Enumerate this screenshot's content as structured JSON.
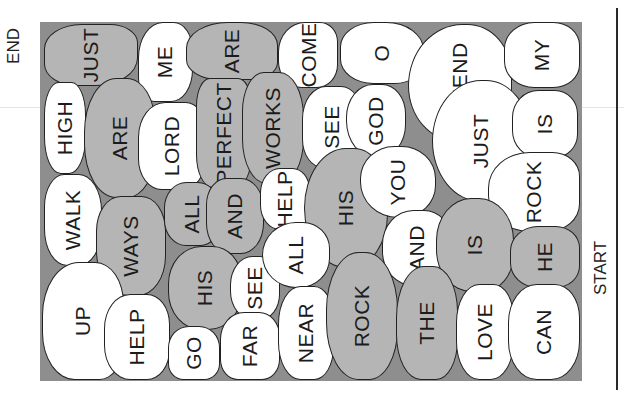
{
  "puzzle": {
    "type": "stepping-stone word path",
    "end_label": "END",
    "start_label": "START",
    "colors": {
      "board": "#8e8e8e",
      "path_stone": "#b5b5b5",
      "other_stone": "#ffffff",
      "outline": "#222222"
    },
    "stones": [
      {
        "word": "JUST",
        "tone": "g",
        "x": 4,
        "y": 2,
        "w": 94,
        "h": 62,
        "r": "40% 30% 45% 35%"
      },
      {
        "word": "ME",
        "tone": "w",
        "x": 98,
        "y": 0,
        "w": 55,
        "h": 80,
        "r": "45% 35% 40% 30%"
      },
      {
        "word": "ARE",
        "tone": "g",
        "x": 146,
        "y": 0,
        "w": 92,
        "h": 58,
        "r": "45% 40% 30% 35%"
      },
      {
        "word": "COME",
        "tone": "w",
        "x": 238,
        "y": 0,
        "w": 60,
        "h": 66,
        "r": "45% 30% 35% 40%"
      },
      {
        "word": "O",
        "tone": "w",
        "x": 300,
        "y": 0,
        "w": 84,
        "h": 62,
        "r": "40% 45% 35% 40%"
      },
      {
        "word": "FRIEND",
        "tone": "w",
        "x": 368,
        "y": 2,
        "w": 104,
        "h": 118,
        "r": "55% 45% 40% 50%"
      },
      {
        "word": "MY",
        "tone": "w",
        "x": 464,
        "y": 0,
        "w": 76,
        "h": 66,
        "r": "40% 35% 35% 40%"
      },
      {
        "word": "HIGH",
        "tone": "w",
        "x": 4,
        "y": 60,
        "w": 42,
        "h": 92,
        "r": "35% 35% 40% 40%"
      },
      {
        "word": "ARE",
        "tone": "g",
        "x": 44,
        "y": 56,
        "w": 72,
        "h": 120,
        "r": "45% 40% 40% 45%"
      },
      {
        "word": "LORD",
        "tone": "w",
        "x": 98,
        "y": 80,
        "w": 68,
        "h": 88,
        "r": "40% 30% 35% 35%"
      },
      {
        "word": "PERFECT",
        "tone": "g",
        "x": 156,
        "y": 56,
        "w": 56,
        "h": 110,
        "r": "25% 25% 30% 30%"
      },
      {
        "word": "WORKS",
        "tone": "g",
        "x": 202,
        "y": 50,
        "w": 62,
        "h": 112,
        "r": "35% 40% 40% 40%"
      },
      {
        "word": "SEE",
        "tone": "w",
        "x": 262,
        "y": 64,
        "w": 60,
        "h": 82,
        "r": "40% 35% 40% 35%"
      },
      {
        "word": "GOD",
        "tone": "w",
        "x": 306,
        "y": 62,
        "w": 60,
        "h": 74,
        "r": "45% 40% 45% 50%"
      },
      {
        "word": "JUST",
        "tone": "w",
        "x": 392,
        "y": 58,
        "w": 98,
        "h": 122,
        "r": "50% 45% 45% 50%"
      },
      {
        "word": "IS",
        "tone": "w",
        "x": 472,
        "y": 68,
        "w": 66,
        "h": 68,
        "r": "40% 35% 35% 40%"
      },
      {
        "word": "WALK",
        "tone": "w",
        "x": 4,
        "y": 152,
        "w": 58,
        "h": 92,
        "r": "35% 40% 40% 40%"
      },
      {
        "word": "WAYS",
        "tone": "g",
        "x": 56,
        "y": 174,
        "w": 70,
        "h": 100,
        "r": "35% 35% 40% 45%"
      },
      {
        "word": "ALL",
        "tone": "g",
        "x": 124,
        "y": 160,
        "w": 56,
        "h": 64,
        "r": "40% 40% 35% 40%"
      },
      {
        "word": "AND",
        "tone": "g",
        "x": 166,
        "y": 156,
        "w": 58,
        "h": 76,
        "r": "35% 40% 40% 40%"
      },
      {
        "word": "HELP",
        "tone": "w",
        "x": 220,
        "y": 146,
        "w": 50,
        "h": 62,
        "r": "40% 35% 35% 40%"
      },
      {
        "word": "HIS",
        "tone": "g",
        "x": 264,
        "y": 126,
        "w": 84,
        "h": 120,
        "r": "50% 40% 45% 50%"
      },
      {
        "word": "YOU",
        "tone": "w",
        "x": 320,
        "y": 124,
        "w": 76,
        "h": 72,
        "r": "45% 45% 45% 50%"
      },
      {
        "word": "ROCK",
        "tone": "w",
        "x": 448,
        "y": 130,
        "w": 92,
        "h": 80,
        "r": "45% 30% 35% 45%"
      },
      {
        "word": "UP",
        "tone": "w",
        "x": 2,
        "y": 240,
        "w": 82,
        "h": 118,
        "r": "45% 35% 30% 40%"
      },
      {
        "word": "HELP",
        "tone": "w",
        "x": 64,
        "y": 272,
        "w": 66,
        "h": 86,
        "r": "40% 35% 35% 40%"
      },
      {
        "word": "HIS",
        "tone": "g",
        "x": 128,
        "y": 224,
        "w": 74,
        "h": 84,
        "r": "45% 40% 45% 45%"
      },
      {
        "word": "SEE",
        "tone": "w",
        "x": 190,
        "y": 234,
        "w": 50,
        "h": 64,
        "r": "45% 40% 40% 45%"
      },
      {
        "word": "ALL",
        "tone": "w",
        "x": 222,
        "y": 200,
        "w": 68,
        "h": 66,
        "r": "50% 40% 45% 50%"
      },
      {
        "word": "AND",
        "tone": "w",
        "x": 342,
        "y": 188,
        "w": 70,
        "h": 76,
        "r": "45% 40% 40% 45%"
      },
      {
        "word": "IS",
        "tone": "g",
        "x": 396,
        "y": 176,
        "w": 78,
        "h": 94,
        "r": "45% 45% 40% 45%"
      },
      {
        "word": "HE",
        "tone": "g",
        "x": 470,
        "y": 204,
        "w": 70,
        "h": 62,
        "r": "40% 35% 35% 40%"
      },
      {
        "word": "GO",
        "tone": "w",
        "x": 128,
        "y": 304,
        "w": 52,
        "h": 54,
        "r": "40% 40% 30% 30%"
      },
      {
        "word": "FAR",
        "tone": "w",
        "x": 180,
        "y": 290,
        "w": 60,
        "h": 68,
        "r": "40% 35% 30% 30%"
      },
      {
        "word": "NEAR",
        "tone": "w",
        "x": 238,
        "y": 264,
        "w": 56,
        "h": 94,
        "r": "40% 35% 35% 40%"
      },
      {
        "word": "ROCK",
        "tone": "g",
        "x": 286,
        "y": 230,
        "w": 72,
        "h": 128,
        "r": "45% 45% 40% 45%"
      },
      {
        "word": "THE",
        "tone": "g",
        "x": 356,
        "y": 244,
        "w": 62,
        "h": 114,
        "r": "45% 40% 35% 40%"
      },
      {
        "word": "LOVE",
        "tone": "w",
        "x": 416,
        "y": 262,
        "w": 58,
        "h": 96,
        "r": "40% 35% 40% 40%"
      },
      {
        "word": "CAN",
        "tone": "w",
        "x": 468,
        "y": 262,
        "w": 72,
        "h": 96,
        "r": "40% 35% 40% 40%"
      }
    ]
  }
}
